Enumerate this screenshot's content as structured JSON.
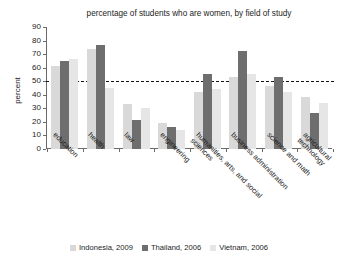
{
  "chart_data": {
    "type": "bar",
    "title": "percentage of students who are women, by field of study",
    "xlabel": "",
    "ylabel": "percent",
    "ylim": [
      0,
      90
    ],
    "yticks": [
      0,
      10,
      20,
      30,
      40,
      50,
      60,
      70,
      80,
      90
    ],
    "grid": false,
    "legend_position": "bottom",
    "annotations": [
      {
        "type": "hline",
        "value": 50,
        "style": "dashed",
        "color": "#141414"
      }
    ],
    "categories": [
      "education",
      "health",
      "law",
      "engineering",
      "humanities, arts, and social\nsciences",
      "business administration",
      "science and math",
      "agricultural technology"
    ],
    "series": [
      {
        "name": "Indonesia, 2009",
        "color": "#d9d9d9",
        "values": [
          61,
          74,
          33,
          19,
          42,
          53,
          46,
          38
        ]
      },
      {
        "name": "Thailand, 2006",
        "color": "#6e6e6e",
        "values": [
          65,
          77,
          21,
          16,
          55,
          72,
          53,
          26
        ]
      },
      {
        "name": "Vietnam, 2006",
        "color": "#e6e6e6",
        "values": [
          66,
          45,
          30,
          14,
          44,
          55,
          42,
          34
        ]
      }
    ]
  }
}
